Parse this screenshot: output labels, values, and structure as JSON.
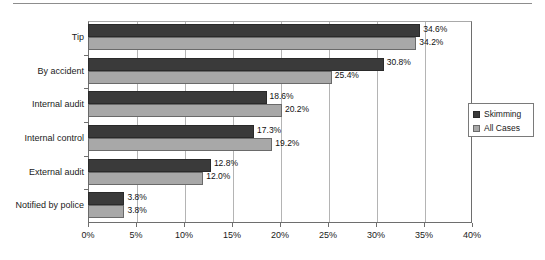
{
  "chart_data": {
    "type": "bar",
    "orientation": "horizontal",
    "title": "",
    "subtitle": "",
    "xlabel": "",
    "ylabel": "",
    "xlim": [
      0,
      40
    ],
    "xtick_step": 5,
    "grid": true,
    "grid_axis": "x",
    "legend_position": "right",
    "value_suffix": "%",
    "categories": [
      "Tip",
      "By accident",
      "Internal audit",
      "Internal control",
      "External audit",
      "Notified by police"
    ],
    "xticks": [
      "0%",
      "5%",
      "10%",
      "15%",
      "20%",
      "25%",
      "30%",
      "35%",
      "40%"
    ],
    "xtick_values": [
      0,
      5,
      10,
      15,
      20,
      25,
      30,
      35,
      40
    ],
    "series": [
      {
        "name": "Skimming",
        "color": "#3a3a3a",
        "values": [
          34.6,
          30.8,
          18.6,
          17.3,
          12.8,
          3.8
        ],
        "labels": [
          "34.6%",
          "30.8%",
          "18.6%",
          "17.3%",
          "12.8%",
          "3.8%"
        ]
      },
      {
        "name": "All Cases",
        "color": "#a8a8a8",
        "values": [
          34.2,
          25.4,
          20.2,
          19.2,
          12.0,
          3.8
        ],
        "labels": [
          "34.2%",
          "25.4%",
          "20.2%",
          "19.2%",
          "12.0%",
          "3.8%"
        ]
      }
    ]
  },
  "legend": {
    "items": [
      {
        "label": "Skimming",
        "swatch": "legend-swatch-skimming"
      },
      {
        "label": "All Cases",
        "swatch": "legend-swatch-all-cases"
      }
    ]
  },
  "colors": {
    "series_skimming": "#3a3a3a",
    "series_all_cases": "#a8a8a8",
    "axis": "#6e6e6e",
    "gridline": "#b4b4b4",
    "background": "#ffffff",
    "text": "#1a1a1a"
  }
}
